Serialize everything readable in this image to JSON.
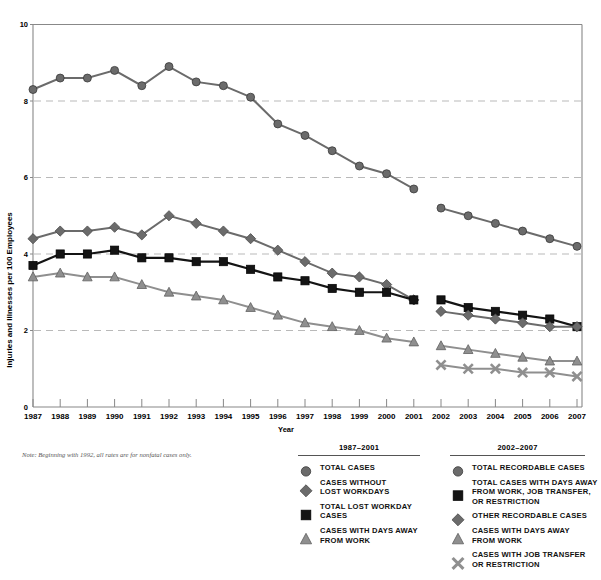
{
  "chart_data": {
    "type": "line",
    "title": "",
    "xlabel": "Year",
    "ylabel": "Injuries and Illnesses per 100 Employees",
    "xlim": [
      1987,
      2007
    ],
    "ylim": [
      0,
      10
    ],
    "ytick_labels": [
      "0",
      "2",
      "4",
      "6",
      "8",
      "10"
    ],
    "ytick_values": [
      0,
      2,
      4,
      6,
      8,
      10
    ],
    "grid": "horizontal dashed at 2, 4, 6, 8",
    "legend_position": "below plot, two grouped blocks",
    "x": [
      1987,
      1988,
      1989,
      1990,
      1991,
      1992,
      1993,
      1994,
      1995,
      1996,
      1997,
      1998,
      1999,
      2000,
      2001,
      2002,
      2003,
      2004,
      2005,
      2006,
      2007
    ],
    "xtick_labels": [
      "1987",
      "1988",
      "1989",
      "1990",
      "1991",
      "1992",
      "1993",
      "1994",
      "1995",
      "1996",
      "1997",
      "1998",
      "1999",
      "2000",
      "2001",
      "2002",
      "2003",
      "2004",
      "2005",
      "2006",
      "2007"
    ],
    "series": [
      {
        "name": "TOTAL CASES",
        "marker": "circle",
        "color": "#6b6b6b",
        "period": "1987-2001",
        "x": [
          1987,
          1988,
          1989,
          1990,
          1991,
          1992,
          1993,
          1994,
          1995,
          1996,
          1997,
          1998,
          1999,
          2000,
          2001
        ],
        "values": [
          8.3,
          8.6,
          8.6,
          8.8,
          8.4,
          8.9,
          8.5,
          8.4,
          8.1,
          7.4,
          7.1,
          6.7,
          6.3,
          6.1,
          5.7
        ]
      },
      {
        "name": "CASES WITHOUT LOST WORKDAYS",
        "marker": "diamond",
        "color": "#6b6b6b",
        "period": "1987-2001",
        "x": [
          1987,
          1988,
          1989,
          1990,
          1991,
          1992,
          1993,
          1994,
          1995,
          1996,
          1997,
          1998,
          1999,
          2000,
          2001
        ],
        "values": [
          4.4,
          4.6,
          4.6,
          4.7,
          4.5,
          5.0,
          4.8,
          4.6,
          4.4,
          4.1,
          3.8,
          3.5,
          3.4,
          3.2,
          2.8
        ]
      },
      {
        "name": "TOTAL LOST WORKDAY CASES",
        "marker": "square",
        "color": "#141414",
        "period": "1987-2001",
        "x": [
          1987,
          1988,
          1989,
          1990,
          1991,
          1992,
          1993,
          1994,
          1995,
          1996,
          1997,
          1998,
          1999,
          2000,
          2001
        ],
        "values": [
          3.7,
          4.0,
          4.0,
          4.1,
          3.9,
          3.9,
          3.8,
          3.8,
          3.6,
          3.4,
          3.3,
          3.1,
          3.0,
          3.0,
          2.8
        ]
      },
      {
        "name": "CASES WITH DAYS AWAY FROM WORK",
        "marker": "triangle",
        "color": "#8f8f8f",
        "period": "1987-2001",
        "x": [
          1987,
          1988,
          1989,
          1990,
          1991,
          1992,
          1993,
          1994,
          1995,
          1996,
          1997,
          1998,
          1999,
          2000,
          2001
        ],
        "values": [
          3.4,
          3.5,
          3.4,
          3.4,
          3.2,
          3.0,
          2.9,
          2.8,
          2.6,
          2.4,
          2.2,
          2.1,
          2.0,
          1.8,
          1.7
        ]
      },
      {
        "name": "TOTAL RECORDABLE CASES",
        "marker": "circle",
        "color": "#6b6b6b",
        "period": "2002-2007",
        "x": [
          2002,
          2003,
          2004,
          2005,
          2006,
          2007
        ],
        "values": [
          5.2,
          5.0,
          4.8,
          4.6,
          4.4,
          4.2
        ]
      },
      {
        "name": "TOTAL CASES WITH DAYS AWAY FROM WORK, JOB TRANSFER, OR RESTRICTION",
        "marker": "square",
        "color": "#141414",
        "period": "2002-2007",
        "x": [
          2002,
          2003,
          2004,
          2005,
          2006,
          2007
        ],
        "values": [
          2.8,
          2.6,
          2.5,
          2.4,
          2.3,
          2.1
        ]
      },
      {
        "name": "OTHER RECORDABLE CASES",
        "marker": "diamond",
        "color": "#6b6b6b",
        "period": "2002-2007",
        "x": [
          2002,
          2003,
          2004,
          2005,
          2006,
          2007
        ],
        "values": [
          2.5,
          2.4,
          2.3,
          2.2,
          2.1,
          2.1
        ]
      },
      {
        "name": "CASES WITH DAYS AWAY FROM WORK",
        "marker": "triangle",
        "color": "#8f8f8f",
        "period": "2002-2007",
        "x": [
          2002,
          2003,
          2004,
          2005,
          2006,
          2007
        ],
        "values": [
          1.6,
          1.5,
          1.4,
          1.3,
          1.2,
          1.2
        ]
      },
      {
        "name": "CASES WITH JOB TRANSFER OR RESTRICTION",
        "marker": "x",
        "color": "#8f8f8f",
        "period": "2002-2007",
        "x": [
          2002,
          2003,
          2004,
          2005,
          2006,
          2007
        ],
        "values": [
          1.1,
          1.0,
          1.0,
          0.9,
          0.9,
          0.8
        ]
      }
    ]
  },
  "axes": {
    "y_title": "Injuries and Illnesses per 100 Employees",
    "x_title": "Year"
  },
  "note": "Note: Beginning with 1992, all rates are for nonfatal cases only.",
  "legend_left": {
    "heading": "1987–2001",
    "items": [
      {
        "marker": "circle",
        "label": "TOTAL CASES"
      },
      {
        "marker": "diamond",
        "label": "CASES WITHOUT\nLOST WORKDAYS"
      },
      {
        "marker": "square",
        "label": "TOTAL LOST WORKDAY\nCASES"
      },
      {
        "marker": "triangle",
        "label": "CASES WITH DAYS AWAY\nFROM WORK"
      }
    ]
  },
  "legend_right": {
    "heading": "2002–2007",
    "items": [
      {
        "marker": "circle",
        "label": "TOTAL RECORDABLE CASES"
      },
      {
        "marker": "square",
        "label": "TOTAL CASES WITH DAYS AWAY\nFROM WORK,  JOB TRANSFER,\nOR RESTRICTION"
      },
      {
        "marker": "diamond",
        "label": "OTHER RECORDABLE CASES"
      },
      {
        "marker": "triangle",
        "label": "CASES WITH DAYS AWAY\nFROM WORK"
      },
      {
        "marker": "x",
        "label": "CASES WITH  JOB TRANSFER\nOR RESTRICTION"
      }
    ]
  },
  "colors": {
    "gray_marker": "#6b6b6b",
    "black_marker": "#141414",
    "light_gray_marker": "#8f8f8f",
    "grid": "#b9b9b9",
    "axis": "#888888"
  }
}
